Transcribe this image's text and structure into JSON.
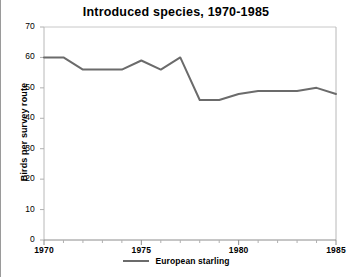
{
  "chart_data": {
    "type": "line",
    "title": "Introduced species, 1970-1985",
    "xlabel": "",
    "ylabel": "Birds per survey route",
    "xlim": [
      1970,
      1985
    ],
    "ylim": [
      0,
      70
    ],
    "ytick_values": [
      0,
      10,
      20,
      30,
      40,
      50,
      60,
      70
    ],
    "ytick_labels": [
      "0",
      "10",
      "20",
      "30",
      "40",
      "50",
      "60",
      "70"
    ],
    "xtick_values": [
      1970,
      1975,
      1980,
      1985
    ],
    "xtick_labels": [
      "1970",
      "1975",
      "1980",
      "1985"
    ],
    "xminor_step": 1,
    "grid": false,
    "legend_position": "below",
    "x": [
      1970,
      1971,
      1972,
      1973,
      1974,
      1975,
      1976,
      1977,
      1978,
      1979,
      1980,
      1981,
      1982,
      1983,
      1984,
      1985
    ],
    "series": [
      {
        "name": "European starling",
        "color": "#6b6b6b",
        "values": [
          60,
          60,
          56,
          56,
          56,
          59,
          56,
          60,
          46,
          46,
          48,
          49,
          49,
          49,
          50,
          48
        ]
      }
    ]
  },
  "legend": {
    "entries": [
      {
        "label": "European starling",
        "swatch_name": "legend-line-european-starling"
      }
    ]
  },
  "axes": {
    "axis_color": "#b0b0b0",
    "tick_color": "#b0b0b0",
    "text_color": "#000000"
  }
}
